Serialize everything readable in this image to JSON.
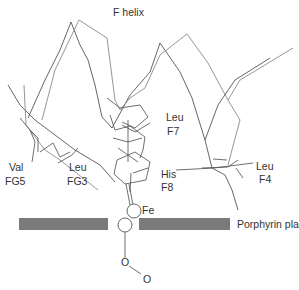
{
  "figure": {
    "title": "F helix",
    "colors": {
      "background": "#ffffff",
      "backbone_dark": "#555555",
      "backbone_light": "#8a8a8a",
      "porphyrin_plane": "#7a7a7a",
      "text": "#333333"
    }
  },
  "labels": {
    "val_fg5": {
      "residue": "Val",
      "position": "FG5"
    },
    "leu_fg3": {
      "residue": "Leu",
      "position": "FG3"
    },
    "leu_f7": {
      "residue": "Leu",
      "position": "F7"
    },
    "his_f8": {
      "residue": "His",
      "position": "F8"
    },
    "leu_f4": {
      "residue": "Leu",
      "position": "F4"
    },
    "fe": "Fe",
    "porphyrin_plane": "Porphyrin plane",
    "oxygen_1": "O",
    "oxygen_2": "O"
  }
}
